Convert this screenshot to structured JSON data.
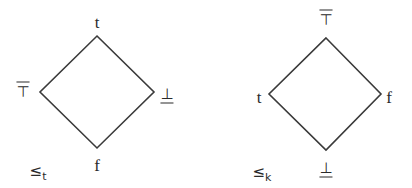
{
  "diagram": {
    "stroke_color": "#3a3a3a",
    "lattices": [
      {
        "name": "truth-ordering",
        "ordering_label": "≤",
        "ordering_subscript": "t",
        "vertices": {
          "top": {
            "label": "t",
            "x": 97,
            "y": 36
          },
          "left": {
            "label": "⊤",
            "x": 40,
            "y": 92
          },
          "right": {
            "label": "⊥",
            "x": 154,
            "y": 92
          },
          "bottom": {
            "label": "f",
            "x": 97,
            "y": 148
          }
        }
      },
      {
        "name": "knowledge-ordering",
        "ordering_label": "≤",
        "ordering_subscript": "k",
        "vertices": {
          "top": {
            "label": "⊤",
            "x": 326,
            "y": 38
          },
          "left": {
            "label": "t",
            "x": 269,
            "y": 94
          },
          "right": {
            "label": "f",
            "x": 381,
            "y": 94
          },
          "bottom": {
            "label": "⊥",
            "x": 326,
            "y": 150
          }
        }
      }
    ]
  }
}
